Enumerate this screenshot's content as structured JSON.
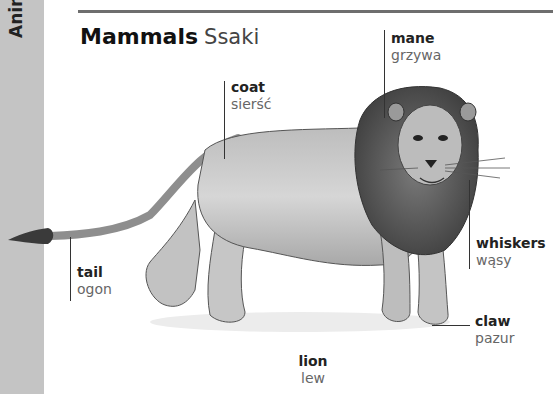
{
  "sidebar": {
    "section_label": "Animals"
  },
  "header": {
    "title_en": "Mammals",
    "title_pl": "Ssaki"
  },
  "illustration": {
    "subject": "lion-drawing"
  },
  "labels": [
    {
      "id": "coat",
      "en": "coat",
      "pl": "sierść"
    },
    {
      "id": "mane",
      "en": "mane",
      "pl": "grzywa"
    },
    {
      "id": "tail",
      "en": "tail",
      "pl": "ogon"
    },
    {
      "id": "whiskers",
      "en": "whiskers",
      "pl": "wąsy"
    },
    {
      "id": "claw",
      "en": "claw",
      "pl": "pazur"
    }
  ],
  "caption": {
    "en": "lion",
    "pl": "lew"
  },
  "colors": {
    "sidebar": "#c4c4c4",
    "rule": "#6e6e6e",
    "text_primary": "#222222",
    "text_secondary": "#666666"
  }
}
